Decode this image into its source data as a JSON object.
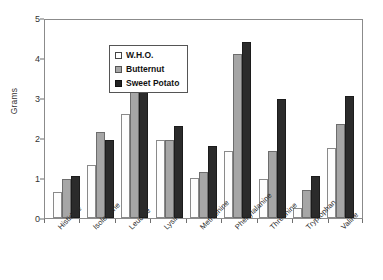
{
  "chart_data": {
    "type": "bar",
    "title": "",
    "xlabel": "",
    "ylabel": "Grams",
    "ylim": [
      0,
      5
    ],
    "yticks": [
      0,
      1,
      2,
      3,
      4,
      5
    ],
    "grid": false,
    "legend_position": "top-left",
    "categories": [
      "Histidine",
      "Isoleucine",
      "Leucine",
      "Lysine",
      "Methionine",
      "Phenylalanine",
      "Threonine",
      "Tryptophan",
      "Valine"
    ],
    "series": [
      {
        "name": "W.H.O.",
        "color": "#ffffff",
        "values": [
          0.65,
          1.32,
          2.6,
          1.95,
          1.0,
          1.67,
          0.97,
          0.25,
          1.75
        ]
      },
      {
        "name": "Butternut",
        "color": "#a6a6a6",
        "values": [
          0.97,
          2.15,
          3.18,
          1.95,
          1.15,
          4.09,
          1.67,
          0.7,
          2.35
        ]
      },
      {
        "name": "Sweet Potato",
        "color": "#2b2b2b",
        "values": [
          1.05,
          1.95,
          3.28,
          2.3,
          1.79,
          4.4,
          2.98,
          1.05,
          3.05
        ]
      }
    ]
  }
}
